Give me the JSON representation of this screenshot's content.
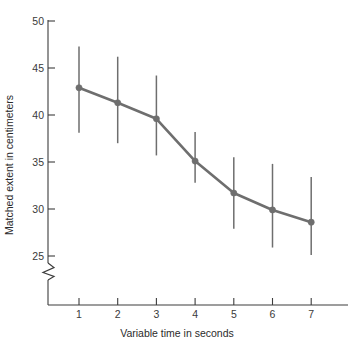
{
  "chart_data": {
    "type": "line",
    "title": "",
    "subtitle": "",
    "xlabel": "Variable time in seconds",
    "ylabel": "Matched extent in centimeters",
    "x": [
      1,
      2,
      3,
      4,
      5,
      6,
      7
    ],
    "values": [
      42.9,
      41.3,
      39.6,
      35.1,
      31.7,
      29.9,
      28.6
    ],
    "series": [
      {
        "name": "Matched extent",
        "values": [
          42.9,
          41.3,
          39.6,
          35.1,
          31.7,
          29.9,
          28.6
        ],
        "error_upper": [
          47.3,
          46.2,
          44.2,
          38.2,
          35.5,
          34.8,
          33.4
        ],
        "error_lower": [
          38.1,
          37.0,
          35.7,
          32.8,
          27.9,
          25.9,
          25.1
        ],
        "color": "#6e6e6e"
      }
    ],
    "xlim": [
      0.45,
      7.55
    ],
    "ylim": [
      24.2,
      50.6
    ],
    "xticks": [
      1,
      2,
      3,
      4,
      5,
      6,
      7
    ],
    "xtick_labels": [
      "1",
      "2",
      "3",
      "4",
      "5",
      "6",
      "7"
    ],
    "yticks": [
      25,
      30,
      35,
      40,
      45,
      50
    ],
    "ytick_labels": [
      "25",
      "30",
      "35",
      "40",
      "45",
      "50"
    ],
    "grid": false,
    "legend": false,
    "legend_position": "none",
    "y_axis_break": true,
    "annotations": []
  },
  "colors": {
    "series": "#6e6e6e",
    "axis": "#3c3c3c",
    "text": "#2b2b2b",
    "background": "#ffffff"
  },
  "axes": {
    "x_title": "Variable time in seconds",
    "y_title": "Matched extent in centimeters"
  }
}
